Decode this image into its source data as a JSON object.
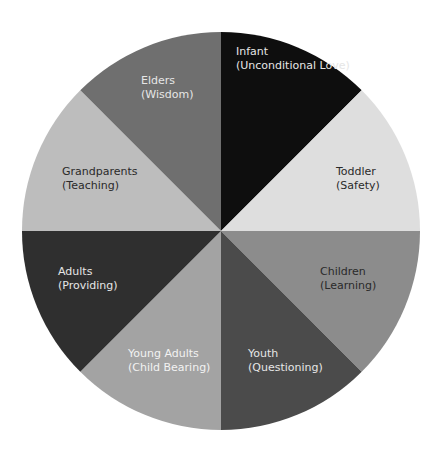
{
  "chart_data": {
    "type": "pie",
    "title": "",
    "center": [
      221,
      231
    ],
    "radius": 199,
    "slices": [
      {
        "name": "Infant",
        "sub": "(Unconditional Love)",
        "value": 12.5,
        "color": "#0e0e0e",
        "text_color": "#e6e6e6",
        "label_pos": [
          236,
          45
        ]
      },
      {
        "name": "Toddler",
        "sub": "(Safety)",
        "value": 12.5,
        "color": "#dedede",
        "text_color": "#2a2a2a",
        "label_pos": [
          336,
          165
        ]
      },
      {
        "name": "Children",
        "sub": "(Learning)",
        "value": 12.5,
        "color": "#8c8c8c",
        "text_color": "#2a2a2a",
        "label_pos": [
          320,
          265
        ]
      },
      {
        "name": "Youth",
        "sub": "(Questioning)",
        "value": 12.5,
        "color": "#4b4b4b",
        "text_color": "#e6e6e6",
        "label_pos": [
          248,
          347
        ]
      },
      {
        "name": "Young Adults",
        "sub": "(Child Bearing)",
        "value": 12.5,
        "color": "#a3a3a3",
        "text_color": "#f2f2f2",
        "label_pos": [
          128,
          347
        ]
      },
      {
        "name": "Adults",
        "sub": "(Providing)",
        "value": 12.5,
        "color": "#2f2f2f",
        "text_color": "#e6e6e6",
        "label_pos": [
          58,
          265
        ]
      },
      {
        "name": "Grandparents",
        "sub": "(Teaching)",
        "value": 12.5,
        "color": "#bdbdbd",
        "text_color": "#2a2a2a",
        "label_pos": [
          62,
          165
        ]
      },
      {
        "name": "Elders",
        "sub": "(Wisdom)",
        "value": 12.5,
        "color": "#6f6f6f",
        "text_color": "#e6e6e6",
        "label_pos": [
          141,
          74
        ]
      }
    ],
    "start_angle_deg": -90,
    "direction": "clockwise",
    "legend": "none"
  }
}
